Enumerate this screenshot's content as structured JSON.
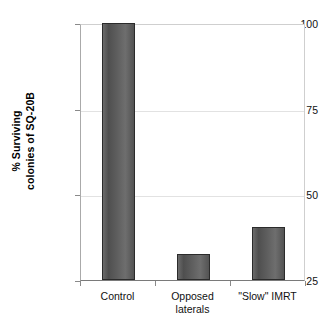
{
  "chart_data": {
    "type": "bar",
    "title": "",
    "xlabel": "",
    "ylabel": "% Surviving colonies of SQ-20B",
    "ylabel_lines": [
      "% Surviving",
      "colonies of SQ-20B"
    ],
    "categories": [
      "Control",
      "Opposed laterals",
      "\"Slow\" IMRT"
    ],
    "category_lines": [
      [
        "Control"
      ],
      [
        "Opposed",
        "laterals"
      ],
      [
        "\"Slow\" IMRT"
      ]
    ],
    "values": [
      100,
      32.5,
      40.5
    ],
    "ylim": [
      25,
      100
    ],
    "yticks": [
      25,
      50,
      75,
      100
    ],
    "ytick_labels": [
      "25",
      "50",
      "75",
      "100"
    ],
    "grid": true,
    "legend": false,
    "bar_color": "#5a5a5a",
    "bar_edge_color": "#2b2b2b",
    "gridline_color": "#e2e2e2",
    "axis_color": "#7a7a7a",
    "background": "#ffffff"
  }
}
